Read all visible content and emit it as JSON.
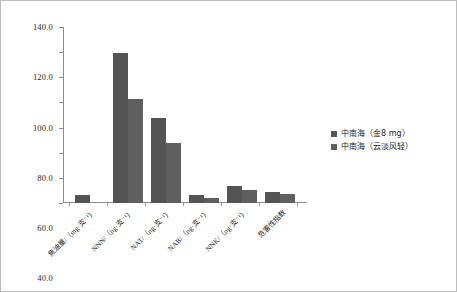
{
  "chart_data": {
    "type": "bar",
    "title": "",
    "xlabel": "",
    "ylabel": "",
    "ylim": [
      0,
      140
    ],
    "ytick_labels": [
      "140.0",
      "120.0",
      "100.0",
      "80.0",
      "60.0",
      "40.0",
      "20.0",
      "0"
    ],
    "ytick_values": [
      140,
      120,
      100,
      80,
      60,
      40,
      20,
      0
    ],
    "grid": false,
    "legend_position": "right",
    "categories": [
      "焦油量/（mg·支⁻¹）",
      "NNN/（ng·支⁻¹）",
      "NAT/（ng·支⁻¹）",
      "NAB/（ng·支⁻¹）",
      "NNK/（ng·支⁻¹）",
      "危害性指数"
    ],
    "series": [
      {
        "name": "中南海（金8 mg）",
        "color": "#545454",
        "values": [
          6.0,
          119.0,
          67.5,
          6.2,
          13.5,
          8.7
        ]
      },
      {
        "name": "中南海（云淡风轻）",
        "color": "#5f5f5f",
        "values": [
          0.0,
          82.5,
          47.5,
          3.8,
          10.0,
          7.2
        ]
      }
    ]
  }
}
